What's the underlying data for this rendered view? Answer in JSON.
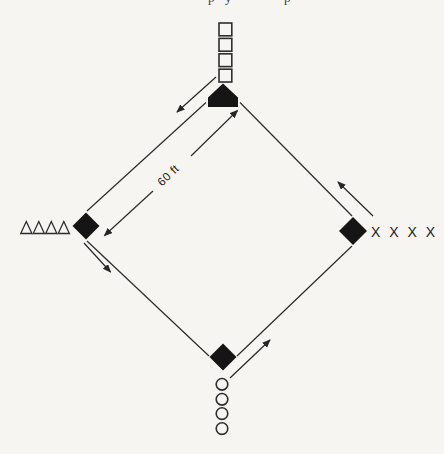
{
  "page": {
    "background": "#f6f5f2",
    "ink": "#262626"
  },
  "top_caption_fragments": [
    "p",
    "y",
    "p"
  ],
  "diamond": {
    "distance_label": "60 ft",
    "bases": [
      {
        "id": "home",
        "shape": "home-plate-pentagon",
        "fill": "black",
        "position": "top"
      },
      {
        "id": "left-base",
        "shape": "filled-diamond",
        "fill": "black",
        "position": "left"
      },
      {
        "id": "right-base",
        "shape": "filled-diamond",
        "fill": "black",
        "position": "right"
      },
      {
        "id": "bottom-base",
        "shape": "filled-diamond",
        "fill": "black",
        "position": "bottom"
      }
    ],
    "rotation_arrows": [
      {
        "from": "home",
        "to": "left-base",
        "direction": "down-left"
      },
      {
        "from": "left-base",
        "to": "bottom-base",
        "direction": "down-right"
      },
      {
        "from": "bottom-base",
        "to": "right-base",
        "direction": "up-right"
      },
      {
        "from": "right-base",
        "to": "home",
        "direction": "up-left"
      }
    ]
  },
  "waiting_lines": {
    "top": {
      "marker": "open-square",
      "count": 4,
      "orientation": "vertical-column"
    },
    "left": {
      "marker": "open-triangle",
      "count": 4,
      "orientation": "horizontal-row"
    },
    "right": {
      "marker": "letter-x",
      "count": 4,
      "text": "X X X X",
      "orientation": "horizontal-row"
    },
    "bottom": {
      "marker": "open-circle",
      "count": 4,
      "orientation": "vertical-column"
    }
  }
}
